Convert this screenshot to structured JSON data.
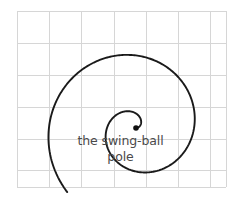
{
  "figure": {
    "background_color": "#ffffff",
    "width": 241,
    "height": 203
  },
  "caption": {
    "line_1": "the swing-ball",
    "line_2": "pole",
    "color": "#4a4a4a"
  },
  "grid": {
    "color": "#d6d6d6",
    "x_lines": [
      17,
      49,
      81,
      114,
      146,
      178,
      210,
      226
    ],
    "y_lines": [
      11,
      43,
      75,
      107,
      139,
      170,
      187
    ],
    "left": 17,
    "top": 11,
    "right": 226,
    "bottom": 187,
    "cell_size": 32
  },
  "chart_data": {
    "type": "line",
    "center": [
      136,
      128
    ],
    "stroke_color": "#1a1a1a",
    "stroke_width": 1.9,
    "direction": "counterclockwise-outward",
    "turns": 1.62,
    "inner_radius": 0,
    "outer_radius": 94,
    "start_angle_deg": 0,
    "end_angle_deg": 583,
    "pole_marker": {
      "name": "the swing-ball pole",
      "x": 136,
      "y": 128,
      "radius": 2.8,
      "color": "#111111"
    },
    "extents": {
      "top_point": [
        140,
        12
      ],
      "bottom_point": [
        131,
        189
      ],
      "right_point": [
        228,
        105
      ],
      "left_endpoint": [
        17,
        128
      ],
      "inner_loop_top": [
        140,
        72
      ]
    },
    "polar_samples_deg_r": [
      [
        0,
        0
      ],
      [
        30,
        4
      ],
      [
        60,
        8
      ],
      [
        90,
        13
      ],
      [
        120,
        18
      ],
      [
        150,
        23
      ],
      [
        180,
        29
      ],
      [
        210,
        34
      ],
      [
        240,
        40
      ],
      [
        270,
        46
      ],
      [
        300,
        52
      ],
      [
        330,
        57
      ],
      [
        360,
        63
      ],
      [
        390,
        68
      ],
      [
        420,
        73
      ],
      [
        450,
        79
      ],
      [
        480,
        84
      ],
      [
        510,
        89
      ],
      [
        540,
        93
      ],
      [
        570,
        96
      ],
      [
        583,
        97
      ]
    ],
    "xlabel": "",
    "ylabel": "",
    "grid": true,
    "legend": "none"
  }
}
